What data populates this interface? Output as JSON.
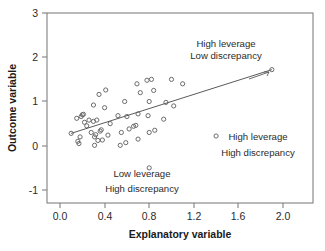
{
  "chart_data": {
    "type": "scatter",
    "title": "",
    "xlabel": "Explanatory variable",
    "ylabel": "Outcome variable",
    "xlim": [
      -0.1,
      2.27
    ],
    "ylim": [
      -1.3,
      3.0
    ],
    "grid": false,
    "legend": null,
    "xticks": [
      "0.0",
      "0.4",
      "0.8",
      "1.2",
      "1.6",
      "2.0"
    ],
    "xtick_values": [
      0.0,
      0.4,
      0.8,
      1.2,
      1.6,
      2.0
    ],
    "yticks": [
      "3",
      "2",
      "1",
      "0",
      "-1"
    ],
    "ytick_values": [
      3,
      2,
      1,
      0,
      -1
    ],
    "series": [
      {
        "name": "observations",
        "marker": "open-circle",
        "points": [
          [
            0.1,
            0.28
          ],
          [
            0.15,
            0.62
          ],
          [
            0.16,
            0.1
          ],
          [
            0.17,
            0.05
          ],
          [
            0.18,
            0.2
          ],
          [
            0.19,
            0.66
          ],
          [
            0.2,
            0.7
          ],
          [
            0.21,
            0.71
          ],
          [
            0.22,
            0.53
          ],
          [
            0.24,
            0.45
          ],
          [
            0.26,
            0.58
          ],
          [
            0.28,
            0.3
          ],
          [
            0.3,
            0.92
          ],
          [
            0.3,
            0.55
          ],
          [
            0.31,
            0.2
          ],
          [
            0.31,
            0.01
          ],
          [
            0.32,
            0.25
          ],
          [
            0.33,
            0.58
          ],
          [
            0.34,
            0.12
          ],
          [
            0.35,
            1.16
          ],
          [
            0.36,
            0.33
          ],
          [
            0.37,
            0.36
          ],
          [
            0.38,
            0.13
          ],
          [
            0.4,
            0.86
          ],
          [
            0.41,
            1.26
          ],
          [
            0.43,
            0.24
          ],
          [
            0.45,
            0.5
          ],
          [
            0.52,
            0.68
          ],
          [
            0.54,
            0.01
          ],
          [
            0.55,
            0.3
          ],
          [
            0.58,
            1.0
          ],
          [
            0.59,
            0.07
          ],
          [
            0.6,
            0.66
          ],
          [
            0.62,
            0.38
          ],
          [
            0.66,
            0.44
          ],
          [
            0.68,
            0.46
          ],
          [
            0.69,
            1.4
          ],
          [
            0.7,
            0.72
          ],
          [
            0.7,
            0.15
          ],
          [
            0.72,
            1.2
          ],
          [
            0.78,
            1.48
          ],
          [
            0.79,
            0.68
          ],
          [
            0.8,
            1.0
          ],
          [
            0.8,
            0.3
          ],
          [
            0.8,
            -0.5
          ],
          [
            0.82,
            1.5
          ],
          [
            0.84,
            1.25
          ],
          [
            0.85,
            0.35
          ],
          [
            0.93,
            0.6
          ],
          [
            0.95,
            0.98
          ],
          [
            1.0,
            1.5
          ],
          [
            1.02,
            0.9
          ],
          [
            1.1,
            1.4
          ],
          [
            1.4,
            0.22
          ],
          [
            1.9,
            1.72
          ]
        ]
      }
    ],
    "fit_line": {
      "name": "regression-line",
      "x0": 0.1,
      "y0": 0.28,
      "x1": 1.9,
      "y1": 1.72
    },
    "annotations": [
      {
        "id": "high-leverage-low-discrepancy",
        "line1": "High leverage",
        "line2": "Low discrepancy",
        "target": [
          1.9,
          1.72
        ]
      },
      {
        "id": "high-leverage-high-discrepancy",
        "line1": "High leverage",
        "line2": "High discrepancy",
        "target": [
          1.4,
          0.22
        ]
      },
      {
        "id": "low-leverage-high-discrepancy",
        "line1": "Low leverage",
        "line2": "High discrepancy",
        "target": [
          0.8,
          -0.5
        ]
      }
    ]
  }
}
